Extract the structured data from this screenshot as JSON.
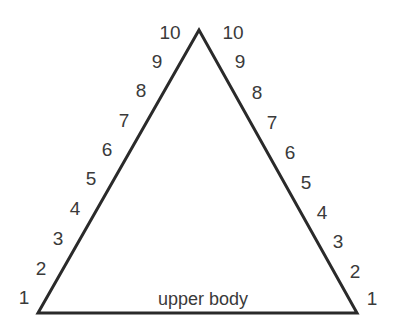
{
  "diagram": {
    "shape": "triangle",
    "stroke_color": "#2a2a2a",
    "text_color": "#3a3a3a",
    "base_label": "upper body",
    "left_scale": [
      "1",
      "2",
      "3",
      "4",
      "5",
      "6",
      "7",
      "8",
      "9",
      "10"
    ],
    "right_scale": [
      "1",
      "2",
      "3",
      "4",
      "5",
      "6",
      "7",
      "8",
      "9",
      "10"
    ]
  }
}
